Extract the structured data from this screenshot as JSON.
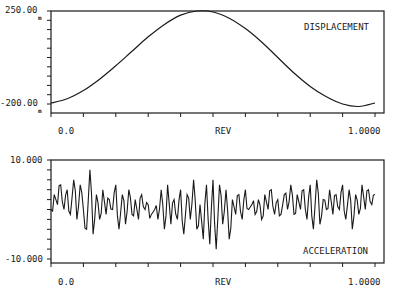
{
  "chart_data": [
    {
      "type": "line",
      "title": "DISPLACEMENT",
      "xlabel": "REV",
      "ylabel": "",
      "x_tick_labels": [
        "0.0",
        "1.0000"
      ],
      "y_tick_labels": [
        "250.00",
        "-200.00"
      ],
      "y_unit": "m",
      "xlim": [
        0.0,
        1.0
      ],
      "ylim": [
        -200.0,
        250.0
      ],
      "grid": false,
      "series": [
        {
          "name": "DISPLACEMENT",
          "x": [
            0.0,
            0.05,
            0.1,
            0.15,
            0.2,
            0.25,
            0.3,
            0.35,
            0.4,
            0.45,
            0.5,
            0.55,
            0.6,
            0.65,
            0.7,
            0.75,
            0.8,
            0.85,
            0.9,
            0.95,
            1.0
          ],
          "values": [
            -195,
            -175,
            -135,
            -80,
            -15,
            55,
            125,
            185,
            230,
            250,
            245,
            215,
            165,
            100,
            25,
            -50,
            -115,
            -165,
            -200,
            -212,
            -195
          ]
        }
      ]
    },
    {
      "type": "line",
      "title": "ACCELERATION",
      "xlabel": "REV",
      "ylabel": "",
      "x_tick_labels": [
        "0.0",
        "1.0000"
      ],
      "y_tick_labels": [
        "10.000",
        "-10.000"
      ],
      "xlim": [
        0.0,
        1.0
      ],
      "ylim": [
        -10.0,
        10.0
      ],
      "grid": false,
      "series": [
        {
          "name": "ACCELERATION",
          "x": [
            0.0,
            0.01,
            0.02,
            0.03,
            0.04,
            0.05,
            0.06,
            0.07,
            0.08,
            0.09,
            0.1,
            0.11,
            0.12,
            0.13,
            0.14,
            0.15,
            0.16,
            0.17,
            0.18,
            0.19,
            0.2,
            0.21,
            0.22,
            0.23,
            0.24,
            0.25,
            0.26,
            0.27,
            0.28,
            0.29,
            0.3,
            0.31,
            0.32,
            0.33,
            0.34,
            0.35,
            0.36,
            0.37,
            0.38,
            0.39,
            0.4,
            0.41,
            0.42,
            0.43,
            0.44,
            0.45,
            0.46,
            0.47,
            0.48,
            0.49,
            0.5,
            0.51,
            0.52,
            0.53,
            0.54,
            0.55,
            0.56,
            0.57,
            0.58,
            0.59,
            0.6,
            0.61,
            0.62,
            0.63,
            0.64,
            0.65,
            0.66,
            0.67,
            0.68,
            0.69,
            0.7,
            0.71,
            0.72,
            0.73,
            0.74,
            0.75,
            0.76,
            0.77,
            0.78,
            0.79,
            0.8,
            0.81,
            0.82,
            0.83,
            0.84,
            0.85,
            0.86,
            0.87,
            0.88,
            0.89,
            0.9,
            0.91,
            0.92,
            0.93,
            0.94,
            0.95,
            0.96,
            0.97,
            0.98,
            0.99,
            1.0
          ],
          "values": [
            0,
            3,
            1,
            5,
            0,
            4,
            -1,
            6,
            -2,
            5,
            0,
            -4,
            8,
            -5,
            3,
            -2,
            4,
            -1,
            2,
            0,
            5,
            -4,
            3,
            -3,
            4,
            -1,
            2,
            -2,
            3,
            0,
            1,
            -1,
            0,
            -2,
            4,
            -4,
            5,
            -3,
            2,
            -2,
            4,
            -5,
            3,
            -2,
            6,
            -4,
            1,
            -6,
            5,
            -7,
            6,
            -8,
            5,
            -3,
            4,
            -6,
            2,
            -1,
            3,
            -2,
            4,
            0,
            1,
            -1,
            2,
            -2,
            3,
            0,
            4,
            -1,
            2,
            -1,
            3,
            0,
            5,
            -1,
            3,
            0,
            4,
            -2,
            5,
            -4,
            6,
            -3,
            2,
            0,
            4,
            -1,
            3,
            0,
            5,
            -2,
            4,
            -4,
            3,
            -1,
            5,
            0,
            4,
            1,
            3
          ]
        }
      ]
    }
  ],
  "top_plot": {
    "label": "DISPLACEMENT",
    "y_max_label": "250.00",
    "y_min_label": "-200.00",
    "y_unit": "m",
    "x_start_label": "0.0",
    "x_mid_label": "REV",
    "x_end_label": "1.0000"
  },
  "bottom_plot": {
    "label": "ACCELERATION",
    "y_max_label": "10.000",
    "y_min_label": "-10.000",
    "x_start_label": "0.0",
    "x_mid_label": "REV",
    "x_end_label": "1.0000"
  }
}
